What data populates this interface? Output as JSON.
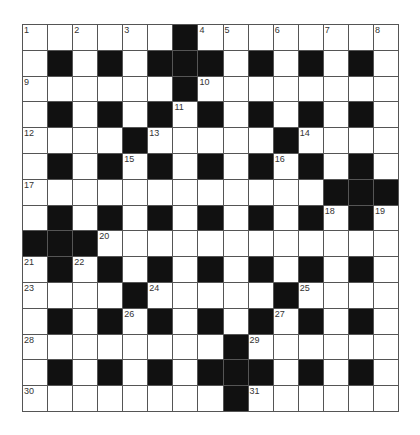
{
  "puzzle": {
    "rows": 15,
    "cols": 15,
    "colors": {
      "black": "#111111",
      "white": "#ffffff",
      "grid_line": "#555555"
    },
    "layout": [
      "WWWWWWBWWWWWWWW",
      "WBWBWBBBWBWBWBW",
      "WWWWWWBWWWWWWWW",
      "WBWBWBWBWBWBWBW",
      "WWWWBWWWWWBWWWW",
      "WBWBWBWBWBWBWBW",
      "WWWWWWWWWWWWBBB",
      "WBWBWBWBWBWBWBW",
      "BBBWWWWWWWWWWWW",
      "WBWBWBWBWBWBWBW",
      "WWWWBWWWWWBWWWW",
      "WBWBWBWBWBWBWBW",
      "WWWWWWWWBWWWWWW",
      "WBWBWBWBBBWBWBW",
      "WWWWWWWWBWWWWWW"
    ],
    "numbers": [
      {
        "r": 0,
        "c": 0,
        "n": "1"
      },
      {
        "r": 0,
        "c": 2,
        "n": "2"
      },
      {
        "r": 0,
        "c": 4,
        "n": "3"
      },
      {
        "r": 0,
        "c": 7,
        "n": "4"
      },
      {
        "r": 0,
        "c": 8,
        "n": "5"
      },
      {
        "r": 0,
        "c": 10,
        "n": "6"
      },
      {
        "r": 0,
        "c": 12,
        "n": "7"
      },
      {
        "r": 0,
        "c": 14,
        "n": "8"
      },
      {
        "r": 2,
        "c": 0,
        "n": "9"
      },
      {
        "r": 2,
        "c": 7,
        "n": "10"
      },
      {
        "r": 3,
        "c": 6,
        "n": "11"
      },
      {
        "r": 4,
        "c": 0,
        "n": "12"
      },
      {
        "r": 4,
        "c": 5,
        "n": "13"
      },
      {
        "r": 4,
        "c": 11,
        "n": "14"
      },
      {
        "r": 5,
        "c": 4,
        "n": "15"
      },
      {
        "r": 5,
        "c": 10,
        "n": "16"
      },
      {
        "r": 6,
        "c": 0,
        "n": "17"
      },
      {
        "r": 7,
        "c": 12,
        "n": "18"
      },
      {
        "r": 7,
        "c": 14,
        "n": "19"
      },
      {
        "r": 8,
        "c": 3,
        "n": "20"
      },
      {
        "r": 9,
        "c": 0,
        "n": "21"
      },
      {
        "r": 9,
        "c": 2,
        "n": "22"
      },
      {
        "r": 10,
        "c": 0,
        "n": "23"
      },
      {
        "r": 10,
        "c": 5,
        "n": "24"
      },
      {
        "r": 10,
        "c": 11,
        "n": "25"
      },
      {
        "r": 11,
        "c": 4,
        "n": "26"
      },
      {
        "r": 11,
        "c": 10,
        "n": "27"
      },
      {
        "r": 12,
        "c": 0,
        "n": "28"
      },
      {
        "r": 12,
        "c": 9,
        "n": "29"
      },
      {
        "r": 14,
        "c": 0,
        "n": "30"
      },
      {
        "r": 14,
        "c": 9,
        "n": "31"
      }
    ]
  }
}
